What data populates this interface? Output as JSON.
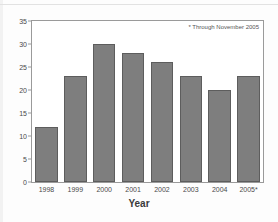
{
  "chart_data": {
    "type": "bar",
    "title": "",
    "subtitle": "",
    "xlabel": "Year",
    "ylabel": "",
    "categories": [
      "1998",
      "1999",
      "2000",
      "2001",
      "2002",
      "2003",
      "2004",
      "2005*"
    ],
    "values": [
      12,
      23,
      30,
      28,
      26,
      23,
      20,
      23
    ],
    "series": [
      {
        "name": "",
        "values": [
          12,
          23,
          30,
          28,
          26,
          23,
          20,
          23
        ]
      }
    ],
    "ylim": [
      0,
      35
    ],
    "yticks": [
      0,
      5,
      10,
      15,
      20,
      25,
      30,
      35
    ],
    "ytick_labels": [
      "0",
      "5",
      "10",
      "15",
      "20",
      "25",
      "30",
      "35"
    ],
    "grid": false,
    "legend": false,
    "legend_position": "none",
    "annotations": [
      "* Through November 2005"
    ],
    "bar_color": "#7e7e7e",
    "bar_border_color": "#5d5d5d",
    "axis_color": "#9a9a9a",
    "text_color": "#4a4a4a"
  },
  "footnote": {
    "text": "* Through November 2005"
  },
  "axes": {
    "x_title": "Year"
  }
}
